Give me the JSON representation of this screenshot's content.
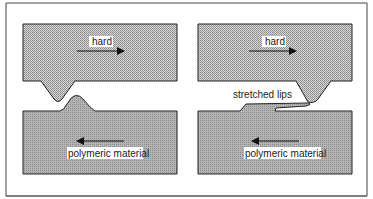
{
  "figure": {
    "type": "schematic",
    "colors": {
      "frame": "#444444",
      "hard_fill": "#c8c8c8",
      "polymer_fill": "#a8a8a8",
      "outline": "#222222",
      "label_bg": "#ffffff"
    },
    "panels": [
      {
        "id": "left",
        "labels": {
          "top_body": "hard",
          "bottom_body": "polymeric material"
        },
        "arrows": {
          "top_direction": "right",
          "bottom_direction": "left"
        }
      },
      {
        "id": "right",
        "labels": {
          "top_body": "hard",
          "bottom_body": "polymeric material",
          "annotation": "stretched lips"
        },
        "arrows": {
          "top_direction": "right",
          "bottom_direction": "left"
        }
      }
    ]
  }
}
